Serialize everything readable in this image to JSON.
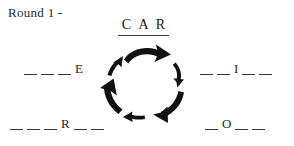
{
  "header": {
    "round_label": "Round 1 -"
  },
  "puzzle": {
    "answer_top": {
      "name": "car",
      "letters": [
        "C",
        "A",
        "R"
      ]
    },
    "slots": [
      {
        "position": "left",
        "name": "left-word-slot",
        "text": "_ _ _ E",
        "cells": [
          {
            "type": "blank",
            "value": "_"
          },
          {
            "type": "blank",
            "value": "_"
          },
          {
            "type": "blank",
            "value": "_"
          },
          {
            "type": "letter",
            "value": "E"
          }
        ]
      },
      {
        "position": "right",
        "name": "right-word-slot",
        "text": "_ _ I _ _",
        "cells": [
          {
            "type": "blank",
            "value": "_"
          },
          {
            "type": "blank",
            "value": "_"
          },
          {
            "type": "letter",
            "value": "I"
          },
          {
            "type": "blank",
            "value": "_"
          },
          {
            "type": "blank",
            "value": "_"
          }
        ]
      },
      {
        "position": "bottom-left",
        "name": "bottom-left-word-slot",
        "text": "_ _ _ R _ _",
        "cells": [
          {
            "type": "blank",
            "value": "_"
          },
          {
            "type": "blank",
            "value": "_"
          },
          {
            "type": "blank",
            "value": "_"
          },
          {
            "type": "letter",
            "value": "R"
          },
          {
            "type": "blank",
            "value": "_"
          },
          {
            "type": "blank",
            "value": "_"
          }
        ]
      },
      {
        "position": "bottom-right",
        "name": "bottom-right-word-slot",
        "text": "_ O _ _",
        "cells": [
          {
            "type": "blank",
            "value": "_"
          },
          {
            "type": "letter",
            "value": "O"
          },
          {
            "type": "blank",
            "value": "_"
          },
          {
            "type": "blank",
            "value": "_"
          }
        ]
      }
    ]
  },
  "cycle_diagram": {
    "name": "clockwise-arrow-cycle",
    "direction": "clockwise",
    "arrow_count": 6,
    "arrow_color": "#111111"
  },
  "colors": {
    "ink": "#1a1a1a",
    "rule": "#3a3a3a",
    "background": "#ffffff"
  }
}
